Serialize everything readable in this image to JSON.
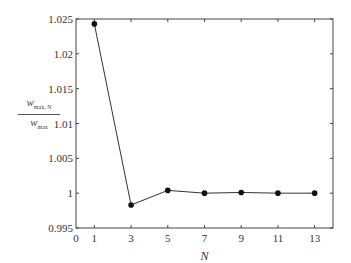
{
  "chart_data": {
    "type": "line",
    "title": "",
    "xlabel": "N",
    "ylabel": "w_max,N / w_max",
    "ylabel_parts": {
      "num_main": "w",
      "num_sub": "max, N",
      "den_main": "w",
      "den_sub": "max"
    },
    "x": [
      1,
      3,
      5,
      7,
      9,
      11,
      13
    ],
    "values": [
      1.0243,
      0.9983,
      1.0004,
      1.0,
      1.0001,
      1.0,
      1.0
    ],
    "xlim": [
      0,
      14
    ],
    "ylim": [
      0.995,
      1.025
    ],
    "xticks": [
      0,
      1,
      3,
      5,
      7,
      9,
      11,
      13
    ],
    "xtick_labels": [
      "0",
      "1",
      "3",
      "5",
      "7",
      "9",
      "11",
      "13"
    ],
    "yticks": [
      0.995,
      1,
      1.005,
      1.01,
      1.015,
      1.02,
      1.025
    ],
    "ytick_labels": [
      "0.995",
      "1",
      "1.005",
      "1.01",
      "1.015",
      "1.02",
      "1.025"
    ],
    "grid": false,
    "legend": null,
    "marker": "filled-circle",
    "line_color": "#333333"
  }
}
